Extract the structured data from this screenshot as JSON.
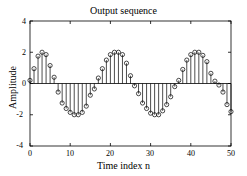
{
  "chart_data": {
    "type": "line",
    "plot_style": "stem",
    "title": "Output sequence",
    "xlabel": "Time index n",
    "ylabel": "Amplitude",
    "xlim": [
      0,
      50
    ],
    "ylim": [
      -4,
      4
    ],
    "xticks": [
      0,
      10,
      20,
      30,
      40,
      50
    ],
    "yticks": [
      -4,
      -2,
      0,
      2,
      4
    ],
    "xtick_labels": [
      "0",
      "10",
      "20",
      "30",
      "40",
      "50"
    ],
    "ytick_labels": [
      "-4",
      "-2",
      "0",
      "2",
      "4"
    ],
    "grid": false,
    "legend": null,
    "marker": "open-circle",
    "line_color": "#000000",
    "baseline_value": 0,
    "x": [
      0,
      1,
      2,
      3,
      4,
      5,
      6,
      7,
      8,
      9,
      10,
      11,
      12,
      13,
      14,
      15,
      16,
      17,
      18,
      19,
      20,
      21,
      22,
      23,
      24,
      25,
      26,
      27,
      28,
      29,
      30,
      31,
      32,
      33,
      34,
      35,
      36,
      37,
      38,
      39,
      40,
      41,
      42,
      43,
      44,
      45,
      46,
      47,
      48,
      49,
      50
    ],
    "values": [
      0.2,
      0.95,
      1.75,
      2.0,
      1.85,
      1.15,
      0.4,
      -0.55,
      -1.25,
      -1.6,
      -1.85,
      -2.0,
      -2.0,
      -1.85,
      -1.45,
      -0.75,
      -0.35,
      0.35,
      0.95,
      1.5,
      1.85,
      2.0,
      2.0,
      1.85,
      1.3,
      0.5,
      -0.15,
      -0.65,
      -1.25,
      -1.6,
      -1.9,
      -2.0,
      -2.0,
      -1.75,
      -1.35,
      -0.85,
      -0.2,
      0.2,
      0.9,
      1.5,
      1.85,
      2.0,
      2.0,
      1.8,
      1.4,
      0.65,
      0.15,
      -0.1,
      -0.55,
      -1.35,
      -1.8
    ]
  },
  "axes": {
    "frame_color": "#000000",
    "background": "#ffffff"
  }
}
